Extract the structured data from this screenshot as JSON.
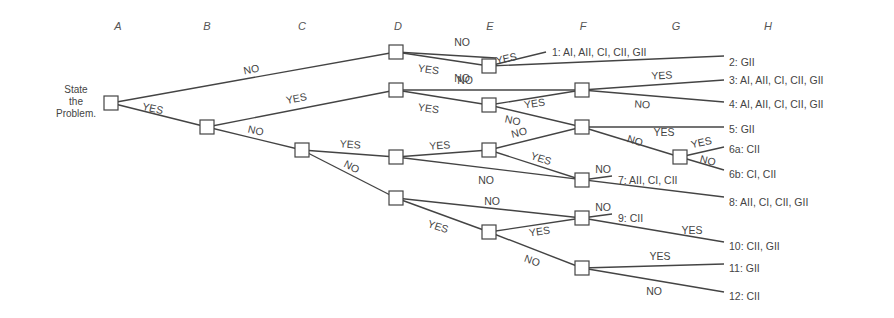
{
  "diagram": {
    "start_label": [
      "State",
      "the",
      "Problem."
    ],
    "columns": [
      {
        "id": "A",
        "x": 118
      },
      {
        "id": "B",
        "x": 207
      },
      {
        "id": "C",
        "x": 302
      },
      {
        "id": "D",
        "x": 398
      },
      {
        "id": "E",
        "x": 490
      },
      {
        "id": "F",
        "x": 583
      },
      {
        "id": "G",
        "x": 676
      },
      {
        "id": "H",
        "x": 768
      }
    ],
    "nodes": [
      {
        "id": "A",
        "x": 111,
        "y": 103
      },
      {
        "id": "B",
        "x": 207,
        "y": 127
      },
      {
        "id": "C",
        "x": 302,
        "y": 150
      },
      {
        "id": "D1",
        "x": 396,
        "y": 52
      },
      {
        "id": "D2",
        "x": 396,
        "y": 90
      },
      {
        "id": "D3",
        "x": 396,
        "y": 157
      },
      {
        "id": "D4",
        "x": 396,
        "y": 198
      },
      {
        "id": "E1",
        "x": 489,
        "y": 66
      },
      {
        "id": "E2",
        "x": 489,
        "y": 105
      },
      {
        "id": "E3",
        "x": 489,
        "y": 150
      },
      {
        "id": "E4",
        "x": 489,
        "y": 232
      },
      {
        "id": "F1",
        "x": 582,
        "y": 90
      },
      {
        "id": "F2",
        "x": 582,
        "y": 127
      },
      {
        "id": "F3",
        "x": 582,
        "y": 180
      },
      {
        "id": "F4",
        "x": 582,
        "y": 218
      },
      {
        "id": "F5",
        "x": 582,
        "y": 268
      },
      {
        "id": "G1",
        "x": 680,
        "y": 157
      }
    ],
    "edges": [
      {
        "from": [
          111,
          103
        ],
        "to": [
          396,
          52
        ],
        "label": "NO",
        "lx": 252,
        "ly": 73,
        "rot": -11
      },
      {
        "from": [
          111,
          103
        ],
        "to": [
          207,
          127
        ],
        "label": "YES",
        "lx": 152,
        "ly": 112,
        "rot": 12
      },
      {
        "from": [
          207,
          127
        ],
        "to": [
          396,
          90
        ],
        "label": "YES",
        "lx": 297,
        "ly": 102,
        "rot": -11
      },
      {
        "from": [
          207,
          127
        ],
        "to": [
          302,
          150
        ],
        "label": "NO",
        "lx": 255,
        "ly": 134,
        "rot": 13
      },
      {
        "from": [
          302,
          150
        ],
        "to": [
          396,
          157
        ],
        "label": "YES",
        "lx": 350,
        "ly": 148,
        "rot": 4
      },
      {
        "from": [
          302,
          150
        ],
        "to": [
          396,
          198
        ],
        "label": "NO",
        "lx": 350,
        "ly": 170,
        "rot": 28
      },
      {
        "from": [
          396,
          52
        ],
        "to": [
          496,
          58
        ],
        "label": "NO",
        "lx": 462,
        "ly": 46,
        "rot": 0
      },
      {
        "from": [
          396,
          52
        ],
        "to": [
          489,
          66
        ],
        "label": "YES",
        "lx": 428,
        "ly": 73,
        "rot": 8
      },
      {
        "from": [
          489,
          66
        ],
        "to": [
          546,
          52
        ],
        "label": "YES",
        "lx": 507,
        "ly": 62,
        "rot": -12
      },
      {
        "from": [
          489,
          66
        ],
        "to": [
          724,
          56
        ],
        "label": "NO",
        "lx": 462,
        "ly": 82,
        "rot": 0
      },
      {
        "from": [
          396,
          90
        ],
        "to": [
          582,
          90
        ],
        "label": "NO",
        "lx": 465,
        "ly": 84,
        "rot": 0
      },
      {
        "from": [
          396,
          90
        ],
        "to": [
          489,
          105
        ],
        "label": "YES",
        "lx": 428,
        "ly": 112,
        "rot": 8
      },
      {
        "from": [
          489,
          105
        ],
        "to": [
          582,
          90
        ],
        "label": "YES",
        "lx": 535,
        "ly": 107,
        "rot": -8
      },
      {
        "from": [
          489,
          105
        ],
        "to": [
          582,
          127
        ],
        "label": "NO",
        "lx": 512,
        "ly": 124,
        "rot": 12
      },
      {
        "from": [
          582,
          90
        ],
        "to": [
          724,
          80
        ],
        "label": "YES",
        "lx": 662,
        "ly": 79,
        "rot": -3
      },
      {
        "from": [
          582,
          90
        ],
        "to": [
          724,
          102
        ],
        "label": "NO",
        "lx": 642,
        "ly": 108,
        "rot": 3
      },
      {
        "from": [
          582,
          127
        ],
        "to": [
          724,
          127
        ],
        "label": "YES",
        "lx": 664,
        "ly": 136,
        "rot": 0
      },
      {
        "from": [
          582,
          127
        ],
        "to": [
          680,
          157
        ],
        "label": "NO",
        "lx": 634,
        "ly": 144,
        "rot": 17
      },
      {
        "from": [
          680,
          157
        ],
        "to": [
          724,
          147
        ],
        "label": "YES",
        "lx": 702,
        "ly": 146,
        "rot": -12
      },
      {
        "from": [
          680,
          157
        ],
        "to": [
          724,
          170
        ],
        "label": "NO",
        "lx": 707,
        "ly": 164,
        "rot": 14
      },
      {
        "from": [
          396,
          157
        ],
        "to": [
          489,
          150
        ],
        "label": "YES",
        "lx": 440,
        "ly": 149,
        "rot": -4
      },
      {
        "from": [
          396,
          157
        ],
        "to": [
          724,
          197
        ],
        "label": "NO",
        "lx": 486,
        "ly": 184,
        "rot": 0
      },
      {
        "from": [
          489,
          150
        ],
        "to": [
          582,
          127
        ],
        "label": "NO",
        "lx": 520,
        "ly": 136,
        "rot": -14
      },
      {
        "from": [
          489,
          150
        ],
        "to": [
          582,
          180
        ],
        "label": "YES",
        "lx": 540,
        "ly": 162,
        "rot": 18
      },
      {
        "from": [
          582,
          180
        ],
        "to": [
          612,
          176
        ],
        "label": "NO",
        "lx": 603,
        "ly": 173,
        "rot": 0
      },
      {
        "from": [
          396,
          198
        ],
        "to": [
          582,
          218
        ],
        "label": "NO",
        "lx": 492,
        "ly": 205,
        "rot": 0
      },
      {
        "from": [
          396,
          198
        ],
        "to": [
          489,
          232
        ],
        "label": "YES",
        "lx": 437,
        "ly": 230,
        "rot": 18
      },
      {
        "from": [
          489,
          232
        ],
        "to": [
          582,
          218
        ],
        "label": "YES",
        "lx": 540,
        "ly": 235,
        "rot": -8
      },
      {
        "from": [
          489,
          232
        ],
        "to": [
          582,
          268
        ],
        "label": "NO",
        "lx": 531,
        "ly": 264,
        "rot": 20
      },
      {
        "from": [
          582,
          218
        ],
        "to": [
          612,
          214
        ],
        "label": "NO",
        "lx": 603,
        "ly": 211,
        "rot": 0
      },
      {
        "from": [
          582,
          218
        ],
        "to": [
          724,
          242
        ],
        "label": "YES",
        "lx": 692,
        "ly": 234,
        "rot": 0
      },
      {
        "from": [
          582,
          268
        ],
        "to": [
          724,
          264
        ],
        "label": "YES",
        "lx": 660,
        "ly": 260,
        "rot": 0
      },
      {
        "from": [
          582,
          268
        ],
        "to": [
          724,
          292
        ],
        "label": "NO",
        "lx": 654,
        "ly": 295,
        "rot": 0
      }
    ],
    "outcomes": [
      {
        "id": "1",
        "text": "1: AI, AII, CI, CII, GII",
        "x": 552,
        "y": 52
      },
      {
        "id": "2",
        "text": "2: GII",
        "x": 729,
        "y": 62
      },
      {
        "id": "3",
        "text": "3: AI, AII, CI, CII, GII",
        "x": 729,
        "y": 80
      },
      {
        "id": "4",
        "text": "4: AI, AII, CI, CII, GII",
        "x": 729,
        "y": 104
      },
      {
        "id": "5",
        "text": "5: GII",
        "x": 729,
        "y": 129
      },
      {
        "id": "6a",
        "text": "6a: CII",
        "x": 729,
        "y": 149
      },
      {
        "id": "6b",
        "text": "6b: CI, CII",
        "x": 729,
        "y": 174
      },
      {
        "id": "7",
        "text": "7: AII, CI, CII",
        "x": 618,
        "y": 180
      },
      {
        "id": "8",
        "text": "8: AII, CI, CII, GII",
        "x": 729,
        "y": 202
      },
      {
        "id": "9",
        "text": "9: CII",
        "x": 618,
        "y": 218
      },
      {
        "id": "10",
        "text": "10: CII, GII",
        "x": 729,
        "y": 246
      },
      {
        "id": "11",
        "text": "11: GII",
        "x": 729,
        "y": 268
      },
      {
        "id": "12",
        "text": "12: CII",
        "x": 729,
        "y": 296
      }
    ]
  }
}
